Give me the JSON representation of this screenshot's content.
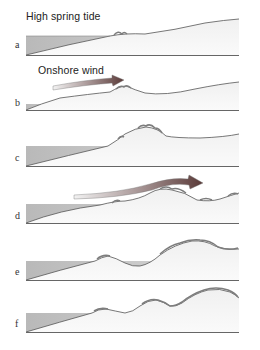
{
  "figure": {
    "title": "High spring tide",
    "wind_label": "Onshore wind",
    "panels": [
      {
        "label": "a",
        "stage": "High spring tide reaches upper beach; embryo vegetation at strandline"
      },
      {
        "label": "b",
        "stage": "Onshore wind blows sand landward; small embryo dune forms"
      },
      {
        "label": "c",
        "stage": "Foredune grows and is colonised by grass"
      },
      {
        "label": "d",
        "stage": "Onshore wind carries sand over foredune; new embryo dune seaward"
      },
      {
        "label": "e",
        "stage": "Second dune ridge develops; older dune grows larger"
      },
      {
        "label": "f",
        "stage": "Multiple dune ridges with slacks between them"
      }
    ]
  },
  "colors": {
    "water": "#c8c8c8",
    "sand": "#f3f3f3",
    "outline": "#555555",
    "grass": "#8a8a8a",
    "arrow_head": "#5a3a38",
    "arrow_tail": "#e8e8e8"
  }
}
